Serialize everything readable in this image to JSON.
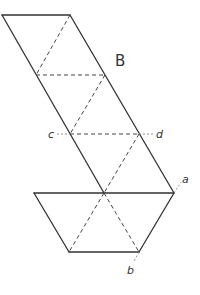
{
  "diagram": {
    "title_label": "B",
    "labels": {
      "a": "a",
      "b": "b",
      "c": "c",
      "d": "d"
    },
    "colors": {
      "line": "#333333",
      "background": "#ffffff"
    },
    "shapes": {
      "parallelogram": [
        [
          2,
          15
        ],
        [
          70,
          15
        ],
        [
          174,
          193
        ],
        [
          104,
          193
        ]
      ],
      "trapezoid": [
        [
          34,
          193
        ],
        [
          174,
          193
        ],
        [
          139,
          252
        ],
        [
          69,
          252
        ]
      ]
    }
  }
}
